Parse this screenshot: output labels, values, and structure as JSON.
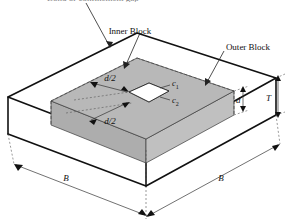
{
  "figure": {
    "type": "isometric-block-diagram",
    "background_color": "#ffffff",
    "line_color": "#111111",
    "inner_block_fill": "#b8b8b8",
    "inner_block_side_fill": "#ababab",
    "inner_block_front_fill": "#c2c2c2",
    "opening_fill": "#ffffff"
  },
  "callouts": {
    "top_label": "Bond or confinement gap",
    "top_label_clipped": true,
    "inner_block": "Inner Block",
    "outer_block": "Outer Block"
  },
  "dimensions": {
    "gap_upper": "d/2",
    "gap_lower": "d/2",
    "opening_side_1": "c",
    "opening_side_1_sub": "1",
    "opening_side_2": "c",
    "opening_side_2_sub": "2",
    "inner_thickness": "d",
    "total_thickness": "T",
    "plan_width_left": "B",
    "plan_width_right": "B"
  }
}
